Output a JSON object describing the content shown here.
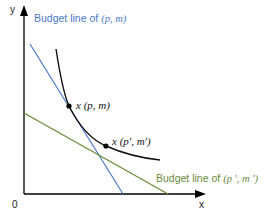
{
  "axes": {
    "x_label": "x",
    "y_label": "y",
    "origin_label": "0"
  },
  "budget_line_1": {
    "prefix": "Budget line of ",
    "args": "(p, m)",
    "color": "#4a78c8"
  },
  "budget_line_2": {
    "prefix": "Budget line of ",
    "args": "(p ', m ')",
    "color": "#6a8a3a"
  },
  "points": {
    "point_1": "x (p, m)",
    "point_2": "x (p', m')"
  },
  "curve_color": "#111111",
  "axis_color": "#000000"
}
